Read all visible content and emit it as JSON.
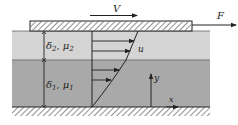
{
  "diagram": {
    "title": "",
    "labels": {
      "V": "V",
      "F": "F",
      "u": "u",
      "layer2": "δ₂, μ₂",
      "layer2_delta": "δ",
      "layer2_delta_sub": "2",
      "layer2_mu": "μ",
      "layer2_mu_sub": "2",
      "layer1_delta": "δ",
      "layer1_delta_sub": "1",
      "layer1_mu": "μ",
      "layer1_mu_sub": "1",
      "y_axis": "y",
      "x_axis": "x"
    },
    "colors": {
      "background": "#ffffff",
      "layer2_fill": "#d4d4d4",
      "layer1_fill": "#a9a9a9",
      "lines": "#222222",
      "plate_fill": "#ffffff"
    },
    "components": [
      "moving plate (hatched)",
      "fluid layer 2 (upper, thickness δ2, viscosity μ2)",
      "fluid layer 1 (lower, thickness δ1, viscosity μ1)",
      "fixed wall (hatched ground)",
      "velocity profile with arrows",
      "force arrow F",
      "plate velocity arrow V",
      "coordinate axes x, y"
    ]
  }
}
